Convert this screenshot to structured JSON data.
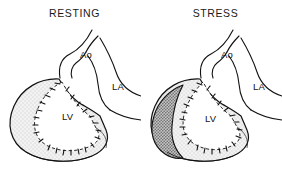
{
  "figure": {
    "caption_type": "medical-illustration",
    "background_color": "#ffffff",
    "line_color": "#111111",
    "myocardium_fill": "#f0f0f0",
    "ischemic_fill": "#a8a8a8",
    "panels": [
      {
        "id": "resting",
        "title": "RESTING",
        "labels": {
          "aorta": "Ao",
          "left_atrium": "LA",
          "left_ventricle": "LV"
        },
        "ischemic_region_present": false
      },
      {
        "id": "stress",
        "title": "STRESS",
        "labels": {
          "aorta": "Ao",
          "left_atrium": "LA",
          "left_ventricle": "LV"
        },
        "ischemic_region_present": true
      }
    ]
  }
}
